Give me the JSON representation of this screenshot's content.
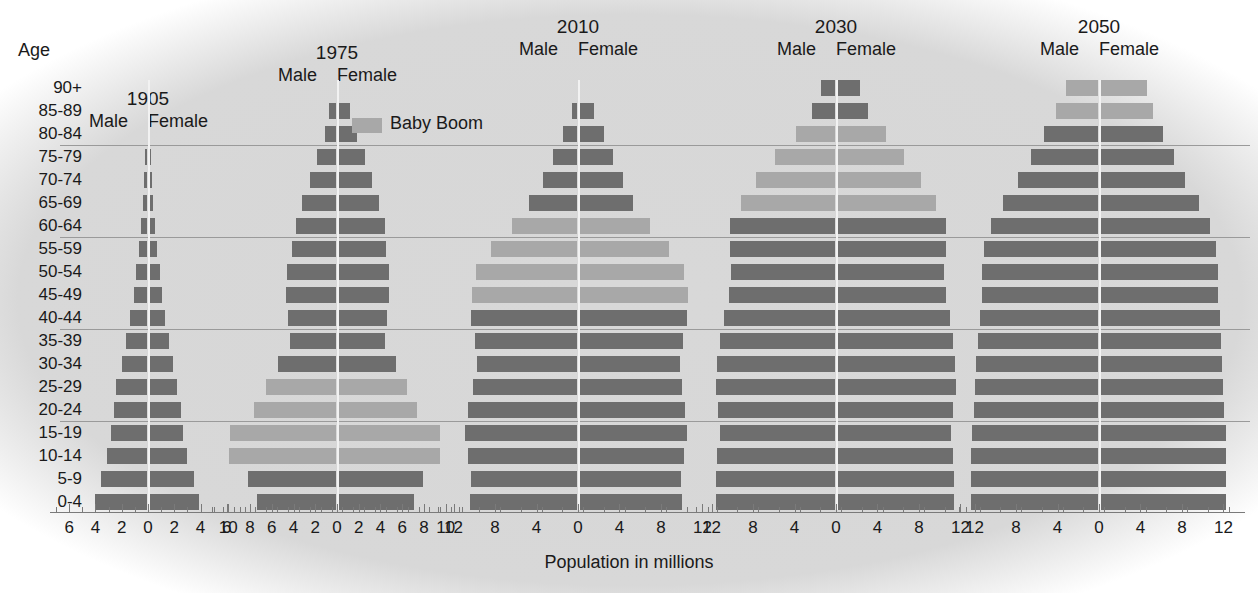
{
  "figure": {
    "age_axis_title": "Age",
    "x_caption": "Population in millions",
    "legend": {
      "label": "Baby Boom",
      "swatch_color": "#a8a8a8"
    },
    "colors": {
      "normal": "#6e6e6e",
      "boom": "#a8a8a8",
      "background": "#d6d6d6",
      "rule": "#9a9a9a"
    },
    "age_groups": [
      "90+",
      "85-89",
      "80-84",
      "75-79",
      "70-74",
      "65-69",
      "60-64",
      "55-59",
      "50-54",
      "45-49",
      "40-44",
      "35-39",
      "30-34",
      "25-29",
      "20-24",
      "15-19",
      "10-14",
      "5-9",
      "0-4"
    ],
    "male_label": "Male",
    "female_label": "Female"
  },
  "chart_data": {
    "type": "bar",
    "xlabel": "Population in millions",
    "ylabel": "Age",
    "grid": false,
    "legend_position": "top-center",
    "categories": [
      "90+",
      "85-89",
      "80-84",
      "75-79",
      "70-74",
      "65-69",
      "60-64",
      "55-59",
      "50-54",
      "45-49",
      "40-44",
      "35-39",
      "30-34",
      "25-29",
      "20-24",
      "15-19",
      "10-14",
      "5-9",
      "0-4"
    ],
    "panels": [
      {
        "year": "1905",
        "xlim": [
          -7,
          7
        ],
        "xticks": [
          6,
          4,
          2,
          0,
          2,
          4,
          6
        ],
        "xtick_step_minor": 1,
        "male": [
          0,
          0,
          0,
          0.25,
          0.3,
          0.4,
          0.5,
          0.7,
          0.9,
          1.1,
          1.4,
          1.7,
          2.0,
          2.4,
          2.6,
          2.8,
          3.1,
          3.6,
          4.0
        ],
        "female": [
          0,
          0,
          0,
          0.25,
          0.3,
          0.4,
          0.5,
          0.7,
          0.9,
          1.1,
          1.3,
          1.6,
          1.9,
          2.2,
          2.5,
          2.7,
          3.0,
          3.5,
          3.9
        ],
        "boom_rows": []
      },
      {
        "year": "1975",
        "xlim": [
          -11.5,
          11.5
        ],
        "xticks": [
          10,
          8,
          6,
          4,
          2,
          0,
          2,
          4,
          6,
          8,
          10
        ],
        "xtick_step_minor": 1,
        "male": [
          0,
          0.7,
          1.1,
          1.8,
          2.5,
          3.2,
          3.8,
          4.1,
          4.6,
          4.7,
          4.5,
          4.3,
          5.4,
          6.5,
          7.6,
          9.8,
          9.9,
          8.2,
          7.4
        ],
        "female": [
          0,
          1.2,
          1.8,
          2.6,
          3.2,
          3.9,
          4.4,
          4.5,
          4.8,
          4.8,
          4.6,
          4.4,
          5.4,
          6.4,
          7.4,
          9.5,
          9.5,
          7.9,
          7.1
        ],
        "boom_rows": [
          "25-29",
          "20-24",
          "15-19",
          "10-14"
        ]
      },
      {
        "year": "2010",
        "xlim": [
          -13.5,
          13.5
        ],
        "xticks": [
          12,
          8,
          4,
          0,
          4,
          8,
          12
        ],
        "xtick_step_minor": 2,
        "male": [
          0,
          0.6,
          1.4,
          2.4,
          3.4,
          4.7,
          6.4,
          8.4,
          9.8,
          10.2,
          10.3,
          9.9,
          9.7,
          10.1,
          10.6,
          10.9,
          10.6,
          10.3,
          10.4
        ],
        "female": [
          0,
          1.5,
          2.5,
          3.4,
          4.3,
          5.3,
          6.9,
          8.8,
          10.2,
          10.6,
          10.5,
          10.1,
          9.8,
          10.0,
          10.3,
          10.5,
          10.2,
          9.9,
          10.0
        ],
        "boom_rows": [
          "60-64",
          "55-59",
          "50-54",
          "45-49"
        ]
      },
      {
        "year": "2030",
        "xlim": [
          -13.5,
          13.5
        ],
        "xticks": [
          12,
          8,
          4,
          0,
          4,
          8,
          12
        ],
        "xtick_step_minor": 2,
        "male": [
          1.4,
          2.3,
          3.9,
          5.9,
          7.7,
          9.2,
          10.2,
          10.2,
          10.1,
          10.3,
          10.8,
          11.2,
          11.5,
          11.6,
          11.4,
          11.2,
          11.5,
          11.6,
          11.6
        ],
        "female": [
          2.3,
          3.1,
          4.8,
          6.6,
          8.2,
          9.6,
          10.6,
          10.6,
          10.4,
          10.6,
          11.0,
          11.3,
          11.5,
          11.6,
          11.3,
          11.1,
          11.3,
          11.4,
          11.4
        ],
        "boom_rows": [
          "80-84",
          "75-79",
          "70-74",
          "65-69"
        ]
      },
      {
        "year": "2050",
        "xlim": [
          -13.5,
          13.5
        ],
        "xticks": [
          12,
          8,
          4,
          0,
          4,
          8,
          12
        ],
        "xtick_step_minor": 2,
        "male": [
          3.2,
          4.1,
          5.3,
          6.6,
          7.8,
          9.3,
          10.4,
          11.1,
          11.3,
          11.3,
          11.5,
          11.7,
          11.9,
          12.0,
          12.1,
          12.2,
          12.3,
          12.3,
          12.3
        ],
        "female": [
          4.6,
          5.2,
          6.2,
          7.2,
          8.3,
          9.6,
          10.7,
          11.3,
          11.5,
          11.5,
          11.7,
          11.8,
          11.9,
          12.0,
          12.1,
          12.2,
          12.2,
          12.2,
          12.2
        ],
        "boom_rows": [
          "90+",
          "85-89"
        ]
      }
    ]
  }
}
